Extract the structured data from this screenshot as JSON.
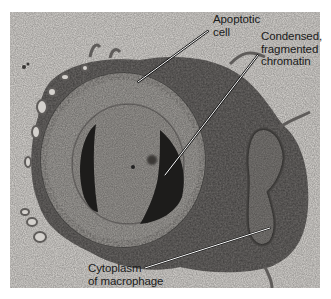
{
  "figure": {
    "background_color": "#d9d6d3",
    "labels": [
      {
        "id": "apoptotic-cell",
        "lines": [
          "Apoptotic",
          "cell"
        ]
      },
      {
        "id": "chromatin",
        "lines": [
          "Condensed,",
          "fragmented",
          "chromatin"
        ]
      },
      {
        "id": "macrophage-cytoplasm",
        "lines": [
          "Cytoplasm",
          "of macrophage"
        ]
      }
    ]
  }
}
